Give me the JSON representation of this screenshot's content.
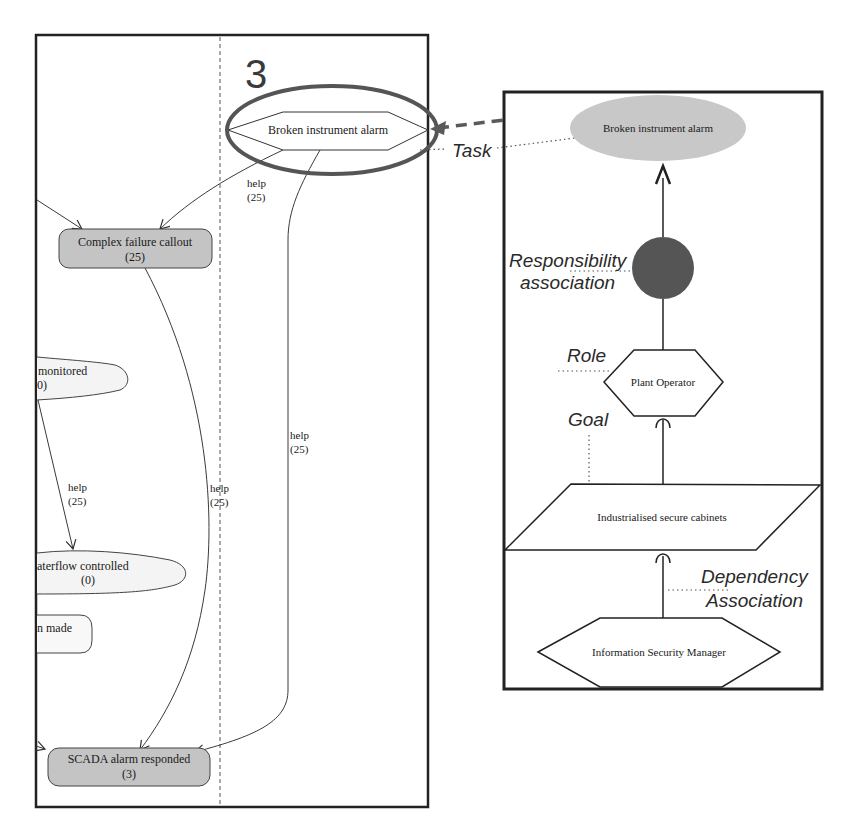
{
  "left_panel": {
    "section_number": "3",
    "nodes": {
      "broken_alarm": {
        "label": "Broken instrument alarm"
      },
      "complex_failure": {
        "label": "Complex failure callout",
        "count": "(25)"
      },
      "monitored": {
        "label": "monitored",
        "count": "0)"
      },
      "waterflow": {
        "label": "aterflow controlled",
        "count": "(0)"
      },
      "decision": {
        "label": "n made"
      },
      "scada": {
        "label": "SCADA alarm responded",
        "count": "(3)"
      }
    },
    "edges": [
      {
        "label": "help",
        "weight": "(25)"
      },
      {
        "label": "help",
        "weight": "(25)"
      },
      {
        "label": "help",
        "weight": "(25)"
      },
      {
        "label": "help",
        "weight": "(25)"
      }
    ]
  },
  "right_panel": {
    "nodes": {
      "task": {
        "label": "Broken instrument alarm"
      },
      "role": {
        "label": "Plant Operator"
      },
      "goal": {
        "label": "Industrialised secure cabinets"
      },
      "dependency_source": {
        "label": "Information Security Manager"
      }
    },
    "annotations": {
      "task": "Task",
      "responsibility_line1": "Responsibility",
      "responsibility_line2": "association",
      "role": "Role",
      "goal": "Goal",
      "dependency_line1": "Dependency",
      "dependency_line2": "Association"
    }
  },
  "colors": {
    "node_gray": "#c4c4c4",
    "task_ellipse": "#c8c8c8",
    "highlight_ring": "#555555",
    "responsibility_circle": "#555555",
    "link_arrow": "#5a5a5a"
  }
}
